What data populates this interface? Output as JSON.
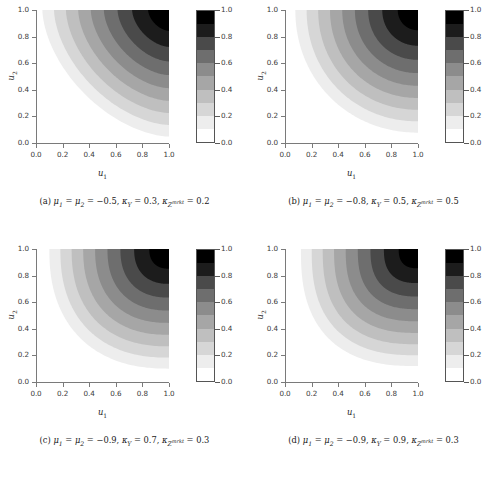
{
  "figure": {
    "type": "contour-grid",
    "rows": 2,
    "cols": 2,
    "background": "#ffffff"
  },
  "axes_common": {
    "xlabel": "u",
    "xlabel_sub": "1",
    "ylabel": "u",
    "ylabel_sub": "2",
    "xticks": [
      "0.0",
      "0.2",
      "0.4",
      "0.6",
      "0.8",
      "1.0"
    ],
    "yticks": [
      "0.0",
      "0.2",
      "0.4",
      "0.6",
      "0.8",
      "1.0"
    ],
    "xlim": [
      0.0,
      1.0
    ],
    "ylim": [
      0.0,
      1.0
    ],
    "grid": false
  },
  "colorbar": {
    "ticks": [
      "0.0",
      "0.2",
      "0.4",
      "0.6",
      "0.8",
      "1.0"
    ],
    "vmin": 0.0,
    "vmax": 1.0,
    "levels": [
      0.0,
      0.1,
      0.2,
      0.3,
      0.4,
      0.5,
      0.6,
      0.7,
      0.8,
      0.9,
      1.0
    ],
    "colors": [
      "#ffffff",
      "#ededed",
      "#d6d6d6",
      "#bfbfbf",
      "#a6a6a6",
      "#8c8c8c",
      "#6e6e6e",
      "#4a4a4a",
      "#1c1c1c",
      "#000000"
    ],
    "border_color": "#555555"
  },
  "chart_data": [
    {
      "type": "contour",
      "panel": "a",
      "title": "",
      "xlabel": "u1",
      "ylabel": "u2",
      "xlim": [
        0.0,
        1.0
      ],
      "ylim": [
        0.0,
        1.0
      ],
      "zlim": [
        0.0,
        1.0
      ],
      "levels": [
        0.0,
        0.1,
        0.2,
        0.3,
        0.4,
        0.5,
        0.6,
        0.7,
        0.8,
        0.9,
        1.0
      ],
      "params": {
        "mu1": -0.5,
        "mu2": -0.5,
        "kappa_Y": 0.3,
        "kappa_Zmrkt": 0.2
      },
      "caption_prefix": "(a)",
      "caption": "(a) μ₁ = μ₂ = −0.5, κᵧ = 0.3, κᶻᵐʳᵏᵗ = 0.2",
      "shape_note": "asymmetric, upper-right corner peak; contours hug left/bottom edges"
    },
    {
      "type": "contour",
      "panel": "b",
      "title": "",
      "xlabel": "u1",
      "ylabel": "u2",
      "xlim": [
        0.0,
        1.0
      ],
      "ylim": [
        0.0,
        1.0
      ],
      "zlim": [
        0.0,
        1.0
      ],
      "levels": [
        0.0,
        0.1,
        0.2,
        0.3,
        0.4,
        0.5,
        0.6,
        0.7,
        0.8,
        0.9,
        1.0
      ],
      "params": {
        "mu1": -0.8,
        "mu2": -0.8,
        "kappa_Y": 0.5,
        "kappa_Zmrkt": 0.5
      },
      "caption_prefix": "(b)",
      "caption": "(b) μ₁ = μ₂ = −0.8, κᵧ = 0.5, κᶻᵐʳᵏᵗ = 0.5",
      "shape_note": "rounded corner contours, peak at upper-right"
    },
    {
      "type": "contour",
      "panel": "c",
      "title": "",
      "xlabel": "u1",
      "ylabel": "u2",
      "xlim": [
        0.0,
        1.0
      ],
      "ylim": [
        0.0,
        1.0
      ],
      "zlim": [
        0.0,
        1.0
      ],
      "levels": [
        0.0,
        0.1,
        0.2,
        0.3,
        0.4,
        0.5,
        0.6,
        0.7,
        0.8,
        0.9,
        1.0
      ],
      "params": {
        "mu1": -0.9,
        "mu2": -0.9,
        "kappa_Y": 0.7,
        "kappa_Zmrkt": 0.3
      },
      "caption_prefix": "(c)",
      "caption": "(c) μ₁ = μ₂ = −0.9, κᵧ = 0.7, κᶻᵐʳᵏᵗ = 0.3",
      "shape_note": "strongly rounded, nearly square nested corner bands"
    },
    {
      "type": "contour",
      "panel": "d",
      "title": "",
      "xlabel": "u1",
      "ylabel": "u2",
      "xlim": [
        0.0,
        1.0
      ],
      "ylim": [
        0.0,
        1.0
      ],
      "zlim": [
        0.0,
        1.0
      ],
      "levels": [
        0.0,
        0.1,
        0.2,
        0.3,
        0.4,
        0.5,
        0.6,
        0.7,
        0.8,
        0.9,
        1.0
      ],
      "params": {
        "mu1": -0.9,
        "mu2": -0.9,
        "kappa_Y": 0.9,
        "kappa_Zmrkt": 0.3
      },
      "caption_prefix": "(d)",
      "caption": "(d) μ₁ = μ₂ = −0.9, κᵧ = 0.9, κᶻᵐʳᵏᵗ = 0.3",
      "shape_note": "most rounded / squarest nested bands, widest black region"
    }
  ],
  "captions": {
    "a": {
      "label": "(a)",
      "mu": "μ",
      "mu1_sub": "1",
      "mu2_sub": "2",
      "mu_value": "−0.5",
      "kappa": "κ",
      "kY_sub": "Y",
      "kY_value": "0.3",
      "kZ_sub": "Z",
      "kZ_sup": "mrkt",
      "kZ_value": "0.2"
    },
    "b": {
      "label": "(b)",
      "mu": "μ",
      "mu1_sub": "1",
      "mu2_sub": "2",
      "mu_value": "−0.8",
      "kappa": "κ",
      "kY_sub": "Y",
      "kY_value": "0.5",
      "kZ_sub": "Z",
      "kZ_sup": "mrkt",
      "kZ_value": "0.5"
    },
    "c": {
      "label": "(c)",
      "mu": "μ",
      "mu1_sub": "1",
      "mu2_sub": "2",
      "mu_value": "−0.9",
      "kappa": "κ",
      "kY_sub": "Y",
      "kY_value": "0.7",
      "kZ_sub": "Z",
      "kZ_sup": "mrkt",
      "kZ_value": "0.3"
    },
    "d": {
      "label": "(d)",
      "mu": "μ",
      "mu1_sub": "1",
      "mu2_sub": "2",
      "mu_value": "−0.9",
      "kappa": "κ",
      "kY_sub": "Y",
      "kY_value": "0.9",
      "kZ_sub": "Z",
      "kZ_sup": "mrkt",
      "kZ_value": "0.3"
    }
  },
  "symbols": {
    "equals": "=",
    "comma": ","
  }
}
